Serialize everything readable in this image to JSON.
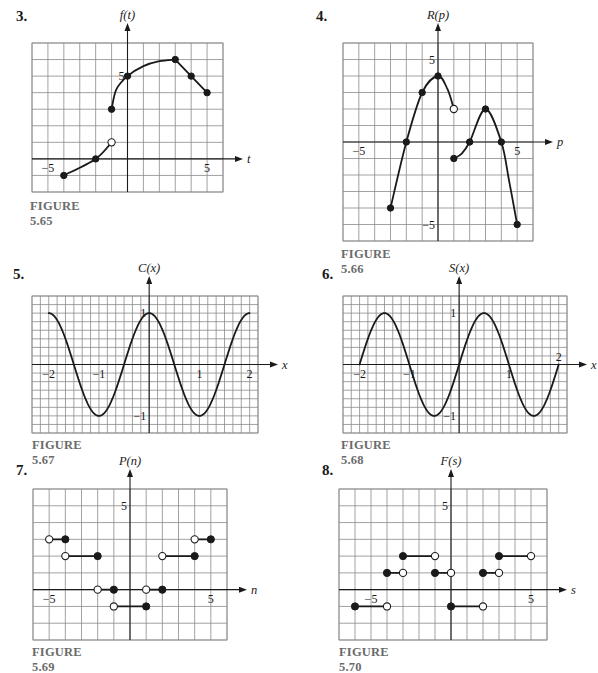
{
  "chart_data": [
    {
      "id": "fig-5-65",
      "problem_number": "3.",
      "caption": "FIGURE 5.65",
      "type": "line",
      "ylabel": "f(t)",
      "xlabel": "t",
      "xlim": [
        -6,
        6
      ],
      "ylim": [
        -2,
        7
      ],
      "grid": true,
      "grid_step": [
        1,
        1
      ],
      "x_tick_labels": [
        {
          "value": -5,
          "label": "−5"
        },
        {
          "value": 5,
          "label": "5"
        }
      ],
      "y_tick_labels": [
        {
          "value": 5,
          "label": "5"
        }
      ],
      "series": [
        {
          "name": "left piece",
          "kind": "smooth",
          "points": [
            [
              -4,
              -1
            ],
            [
              -2,
              0
            ],
            [
              -1,
              1
            ]
          ]
        },
        {
          "name": "right curve",
          "kind": "smooth",
          "points": [
            [
              -1,
              3
            ],
            [
              -0.7,
              4.2
            ],
            [
              0,
              5
            ],
            [
              1,
              5.6
            ],
            [
              2,
              5.9
            ],
            [
              3,
              6
            ]
          ]
        },
        {
          "name": "right linear",
          "kind": "linear",
          "points": [
            [
              3,
              6
            ],
            [
              4,
              5
            ],
            [
              5,
              4
            ]
          ]
        }
      ],
      "markers": [
        {
          "x": -4,
          "y": -1,
          "style": "filled"
        },
        {
          "x": -2,
          "y": 0,
          "style": "filled"
        },
        {
          "x": -1,
          "y": 1,
          "style": "open"
        },
        {
          "x": -1,
          "y": 3,
          "style": "filled"
        },
        {
          "x": 0,
          "y": 5,
          "style": "filled"
        },
        {
          "x": 3,
          "y": 6,
          "style": "filled"
        },
        {
          "x": 4,
          "y": 5,
          "style": "filled"
        },
        {
          "x": 5,
          "y": 4,
          "style": "filled"
        }
      ]
    },
    {
      "id": "fig-5-66",
      "problem_number": "4.",
      "caption": "FIGURE 5.66",
      "type": "line",
      "ylabel": "R(p)",
      "xlabel": "p",
      "xlim": [
        -6,
        6
      ],
      "ylim": [
        -6,
        6
      ],
      "grid": true,
      "grid_step": [
        1,
        1
      ],
      "x_tick_labels": [
        {
          "value": -5,
          "label": "−5"
        },
        {
          "value": 5,
          "label": "5"
        }
      ],
      "y_tick_labels": [
        {
          "value": 5,
          "label": "5"
        },
        {
          "value": -5,
          "label": "−5"
        }
      ],
      "series": [
        {
          "name": "left hump",
          "kind": "smooth",
          "points": [
            [
              -3,
              -4
            ],
            [
              -2,
              0
            ],
            [
              -1,
              3
            ],
            [
              0,
              4
            ],
            [
              0.6,
              3.2
            ],
            [
              1,
              2
            ]
          ]
        },
        {
          "name": "right hump",
          "kind": "smooth",
          "points": [
            [
              1,
              -1
            ],
            [
              1.5,
              -0.7
            ],
            [
              2,
              0
            ],
            [
              3,
              2
            ],
            [
              4,
              0
            ],
            [
              4.5,
              -2.4
            ],
            [
              5,
              -5
            ]
          ]
        }
      ],
      "markers": [
        {
          "x": -3,
          "y": -4,
          "style": "filled"
        },
        {
          "x": -2,
          "y": 0,
          "style": "filled"
        },
        {
          "x": -1,
          "y": 3,
          "style": "filled"
        },
        {
          "x": 0,
          "y": 4,
          "style": "filled"
        },
        {
          "x": 1,
          "y": 2,
          "style": "open"
        },
        {
          "x": 1,
          "y": -1,
          "style": "filled"
        },
        {
          "x": 2,
          "y": 0,
          "style": "filled"
        },
        {
          "x": 3,
          "y": 2,
          "style": "filled"
        },
        {
          "x": 4,
          "y": 0,
          "style": "filled"
        },
        {
          "x": 5,
          "y": -5,
          "style": "filled"
        }
      ]
    },
    {
      "id": "fig-5-67",
      "problem_number": "5.",
      "caption": "FIGURE 5.67",
      "type": "line",
      "ylabel": "C(x)",
      "xlabel": "x",
      "function": "cos(pi*x)",
      "domain": [
        -2,
        2
      ],
      "xlim": [
        -2.333,
        2.167
      ],
      "ylim": [
        -1.333,
        1.333
      ],
      "grid": true,
      "grid_step": [
        0.1667,
        0.1667
      ],
      "x_tick_labels": [
        {
          "value": -2,
          "label": "−2"
        },
        {
          "value": -1,
          "label": "−1"
        },
        {
          "value": 1,
          "label": "1"
        },
        {
          "value": 2,
          "label": "2"
        }
      ],
      "y_tick_labels": [
        {
          "value": 1,
          "label": "1"
        },
        {
          "value": -1,
          "label": "−1"
        }
      ],
      "key_points": [
        [
          -2,
          1
        ],
        [
          -1.5,
          0
        ],
        [
          -1,
          -1
        ],
        [
          -0.5,
          0
        ],
        [
          0,
          1
        ],
        [
          0.5,
          0
        ],
        [
          1,
          -1
        ],
        [
          1.5,
          0
        ],
        [
          2,
          1
        ]
      ]
    },
    {
      "id": "fig-5-68",
      "problem_number": "6.",
      "caption": "FIGURE 5.68",
      "type": "line",
      "ylabel": "S(x)",
      "xlabel": "x",
      "function": "sin(pi*x)",
      "domain": [
        -2,
        2
      ],
      "xlim": [
        -2.333,
        2.167
      ],
      "ylim": [
        -1.333,
        1.333
      ],
      "grid": true,
      "grid_step": [
        0.1667,
        0.1667
      ],
      "x_tick_labels": [
        {
          "value": -2,
          "label": "−2"
        },
        {
          "value": -1,
          "label": "−1"
        },
        {
          "value": 1,
          "label": "1"
        },
        {
          "value": 2,
          "label": "2",
          "above": true
        }
      ],
      "y_tick_labels": [
        {
          "value": 1,
          "label": "1"
        },
        {
          "value": -1,
          "label": "−1"
        }
      ],
      "key_points": [
        [
          -2,
          0
        ],
        [
          -1.5,
          1
        ],
        [
          -1,
          0
        ],
        [
          -0.5,
          -1
        ],
        [
          0,
          0
        ],
        [
          0.5,
          1
        ],
        [
          1,
          0
        ],
        [
          1.5,
          -1
        ],
        [
          2,
          0
        ]
      ]
    },
    {
      "id": "fig-5-69",
      "problem_number": "7.",
      "caption": "FIGURE 5.69",
      "type": "step",
      "ylabel": "P(n)",
      "xlabel": "n",
      "xlim": [
        -6,
        6
      ],
      "ylim": [
        -3,
        6
      ],
      "grid": true,
      "grid_step": [
        1,
        1
      ],
      "x_tick_labels": [
        {
          "value": -5,
          "label": "−5"
        },
        {
          "value": 5,
          "label": "5"
        }
      ],
      "y_tick_labels": [
        {
          "value": 5,
          "label": "5"
        }
      ],
      "segments": [
        {
          "x1": -5,
          "x2": -4,
          "y": 3,
          "left": "open",
          "right": "filled"
        },
        {
          "x1": -4,
          "x2": -2,
          "y": 2,
          "left": "open",
          "right": "filled"
        },
        {
          "x1": -2,
          "x2": -1,
          "y": 0,
          "left": "open",
          "right": "filled"
        },
        {
          "x1": -1,
          "x2": 1,
          "y": -1,
          "left": "open",
          "right": "filled"
        },
        {
          "x1": 1,
          "x2": 2,
          "y": 0,
          "left": "open",
          "right": "filled"
        },
        {
          "x1": 2,
          "x2": 4,
          "y": 2,
          "left": "open",
          "right": "filled"
        },
        {
          "x1": 4,
          "x2": 5,
          "y": 3,
          "left": "open",
          "right": "filled"
        }
      ]
    },
    {
      "id": "fig-5-70",
      "problem_number": "8.",
      "caption": "FIGURE 5.70",
      "type": "step",
      "ylabel": "F(s)",
      "xlabel": "s",
      "xlim": [
        -7,
        6
      ],
      "ylim": [
        -3,
        6
      ],
      "grid": true,
      "grid_step": [
        1,
        1
      ],
      "x_tick_labels": [
        {
          "value": -5,
          "label": "−5"
        },
        {
          "value": 5,
          "label": "5"
        }
      ],
      "y_tick_labels": [
        {
          "value": 5,
          "label": "5"
        }
      ],
      "segments": [
        {
          "x1": -6,
          "x2": -4,
          "y": -1,
          "left": "filled",
          "right": "open"
        },
        {
          "x1": -4,
          "x2": -3,
          "y": 1,
          "left": "filled",
          "right": "open"
        },
        {
          "x1": -3,
          "x2": -1,
          "y": 2,
          "left": "filled",
          "right": "open"
        },
        {
          "x1": -1,
          "x2": 0,
          "y": 1,
          "left": "filled",
          "right": "open"
        },
        {
          "x1": 0,
          "x2": 2,
          "y": -1,
          "left": "filled",
          "right": "open"
        },
        {
          "x1": 2,
          "x2": 3,
          "y": 1,
          "left": "filled",
          "right": "open"
        },
        {
          "x1": 3,
          "x2": 5,
          "y": 2,
          "left": "filled",
          "right": "open"
        }
      ]
    }
  ],
  "layout": {
    "panels": [
      {
        "num_pos": [
          16,
          8
        ],
        "grid_box": [
          32,
          43,
          223,
          192
        ],
        "caption_pos": [
          30,
          199
        ]
      },
      {
        "num_pos": [
          316,
          8
        ],
        "grid_box": [
          343,
          43,
          533,
          241
        ],
        "caption_pos": [
          341,
          247
        ]
      },
      {
        "num_pos": [
          13,
          266
        ],
        "grid_box": [
          32,
          296,
          258,
          433
        ],
        "caption_pos": [
          32,
          438
        ]
      },
      {
        "num_pos": [
          322,
          266
        ],
        "grid_box": [
          343,
          296,
          567,
          433
        ],
        "caption_pos": [
          341,
          438
        ]
      },
      {
        "num_pos": [
          16,
          462
        ],
        "grid_box": [
          33,
          489,
          227,
          640
        ],
        "caption_pos": [
          32,
          645
        ]
      },
      {
        "num_pos": [
          322,
          462
        ],
        "grid_box": [
          339,
          489,
          547,
          640
        ],
        "caption_pos": [
          339,
          645
        ]
      }
    ]
  }
}
